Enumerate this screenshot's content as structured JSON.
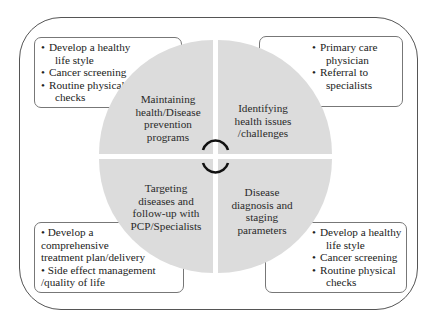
{
  "diagram": {
    "quadrants": [
      {
        "id": "top-left",
        "label": "Maintaining health/Disease prevention programs",
        "lines": [
          "Maintaining",
          "health/Disease",
          "prevention",
          "programs"
        ]
      },
      {
        "id": "top-right",
        "label": "Identifying health issues /challenges",
        "lines": [
          "Identifying",
          "health issues",
          "/challenges"
        ]
      },
      {
        "id": "bottom-left",
        "label": "Targeting diseases and follow-up with PCP/Specialists",
        "lines": [
          "Targeting",
          "diseases and",
          "follow-up with",
          "PCP/Specialists"
        ]
      },
      {
        "id": "bottom-right",
        "label": "Disease diagnosis and staging parameters",
        "lines": [
          "Disease",
          "diagnosis and",
          "staging",
          "parameters"
        ]
      }
    ],
    "boxes": {
      "top_left": {
        "items": [
          "Develop a healthy",
          "life style",
          "Cancer screening",
          "Routine physical",
          "checks"
        ],
        "bullets": [
          true,
          false,
          true,
          true,
          false
        ]
      },
      "top_right": {
        "items": [
          "Primary care",
          "physician",
          "Referral to",
          "specialists"
        ],
        "bullets": [
          true,
          false,
          true,
          false
        ]
      },
      "bottom_left": {
        "items": [
          "• Develop a",
          "comprehensive",
          "treatment plan/delivery",
          "• Side effect management",
          "/quality of life"
        ]
      },
      "bottom_right": {
        "items": [
          "Develop a healthy",
          "life style",
          "Cancer screening",
          "Routine physical",
          "checks"
        ],
        "bullets": [
          true,
          false,
          true,
          true,
          false
        ]
      }
    },
    "center_icon": "cycle-arrows-icon",
    "colors": {
      "circle_fill": "#dcdcdc",
      "border": "#555555",
      "text": "#222222",
      "arrow": "#111111"
    }
  }
}
